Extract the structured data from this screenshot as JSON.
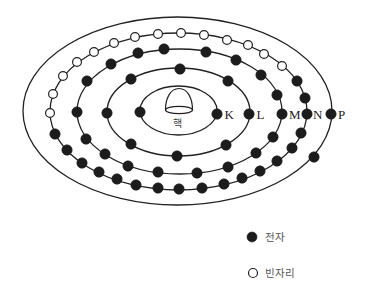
{
  "colors": {
    "line": "#222222",
    "electron": "#1c1c1c",
    "vacancy_fill": "#ffffff",
    "text": "#222222",
    "legend_text": "#555555"
  },
  "diagram": {
    "nucleus": {
      "label": "핵"
    },
    "shells": [
      {
        "label": "K",
        "electron_count": 2,
        "vacancy_count": 0,
        "orbit": {
          "cx": 178.5,
          "cy": 110.5,
          "rx": 38.5,
          "ry": 24.5
        },
        "electrons": [
          [
            140,
            112
          ],
          [
            217,
            114
          ]
        ],
        "vacancies": []
      },
      {
        "label": "L",
        "electron_count": 8,
        "vacancy_count": 0,
        "orbit": {
          "cx": 178.5,
          "cy": 112,
          "rx": 71.5,
          "ry": 44
        },
        "electrons": [
          [
            107,
            113
          ],
          [
            131,
            79
          ],
          [
            180,
            69
          ],
          [
            228,
            81
          ],
          [
            249,
            114
          ],
          [
            226,
            145
          ],
          [
            177,
            156
          ],
          [
            131,
            144
          ]
        ],
        "vacancies": []
      },
      {
        "label": "M",
        "electron_count": 18,
        "vacancy_count": 0,
        "orbit": {
          "cx": 179.5,
          "cy": 111.5,
          "rx": 102.5,
          "ry": 62.5
        },
        "electrons": [
          [
            77,
            112
          ],
          [
            87,
            81
          ],
          [
            111,
            64
          ],
          [
            138,
            53
          ],
          [
            164,
            49
          ],
          [
            206,
            52
          ],
          [
            236,
            60
          ],
          [
            261,
            75
          ],
          [
            277,
            95
          ],
          [
            282,
            114
          ],
          [
            273,
            137
          ],
          [
            256,
            153
          ],
          [
            228,
            167
          ],
          [
            197,
            173
          ],
          [
            158,
            172
          ],
          [
            128,
            166
          ],
          [
            105,
            154
          ],
          [
            86,
            139
          ]
        ],
        "vacancies": []
      },
      {
        "label": "N",
        "electron_count": 18,
        "vacancy_count": 14,
        "orbit": {
          "cx": 178.5,
          "cy": 111.5,
          "rx": 128.5,
          "ry": 78.5
        },
        "electrons": [
          [
            297,
            81
          ],
          [
            305,
            98
          ],
          [
            307,
            114
          ],
          [
            301,
            133
          ],
          [
            292,
            148
          ],
          [
            277,
            161
          ],
          [
            260,
            171
          ],
          [
            242,
            178
          ],
          [
            224,
            184
          ],
          [
            202,
            188
          ],
          [
            179,
            189
          ],
          [
            158,
            188
          ],
          [
            136,
            185
          ],
          [
            117,
            179
          ],
          [
            99,
            172
          ],
          [
            82,
            163
          ],
          [
            67,
            150
          ],
          [
            55,
            134
          ]
        ],
        "vacancies": [
          [
            50,
            113
          ],
          [
            53,
            94
          ],
          [
            63,
            76
          ],
          [
            77,
            62
          ],
          [
            94,
            52
          ],
          [
            114,
            43
          ],
          [
            135,
            37
          ],
          [
            158,
            34
          ],
          [
            181,
            33
          ],
          [
            204,
            35
          ],
          [
            227,
            40
          ],
          [
            248,
            45
          ],
          [
            264,
            54
          ],
          [
            282,
            66
          ]
        ]
      },
      {
        "label": "P",
        "electron_count": 2,
        "vacancy_count": 0,
        "orbit": {
          "cx": 177.5,
          "cy": 111,
          "rx": 154.5,
          "ry": 94
        },
        "electrons": [
          [
            331,
            114
          ],
          [
            314,
            157
          ]
        ],
        "vacancies": []
      }
    ]
  },
  "legend": {
    "items": [
      {
        "symbol": "filled-circle",
        "label": "전자"
      },
      {
        "symbol": "open-circle",
        "label": "빈자리"
      }
    ]
  }
}
